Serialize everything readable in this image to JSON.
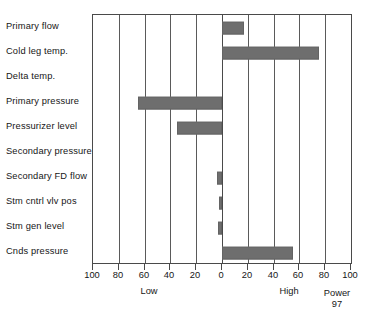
{
  "chart_data": {
    "type": "bar",
    "orientation": "horizontal",
    "title": "",
    "xlabel": "",
    "ylabel": "",
    "xlim": [
      -100,
      100
    ],
    "grid": true,
    "legend": false,
    "zero_at_center": true,
    "categories": [
      "Primary flow",
      "Cold leg temp.",
      "Delta temp.",
      "Primary pressure",
      "Pressurizer level",
      "Secondary pressure",
      "Secondary FD flow",
      "Stm cntrl vlv pos",
      "Stm gen level",
      "Cnds pressure"
    ],
    "values": [
      17,
      75,
      0,
      -65,
      -35,
      0,
      -4,
      -2,
      -3,
      55
    ],
    "tick_labels": [
      "100",
      "80",
      "60",
      "40",
      "20",
      "0",
      "20",
      "40",
      "60",
      "80",
      "100"
    ],
    "tick_values": [
      -100,
      -80,
      -60,
      -40,
      -20,
      0,
      20,
      40,
      60,
      80,
      100
    ],
    "annotations": {
      "low": "Low",
      "high": "High",
      "power_label": "Power",
      "power_value": "97"
    },
    "colors": {
      "bar_fill": "#6e6e6e",
      "bar_stroke": "#636363",
      "grid": "#5a5a5a",
      "axis": "#4a4a4a",
      "background": "#ffffff",
      "text": "#161616"
    }
  }
}
